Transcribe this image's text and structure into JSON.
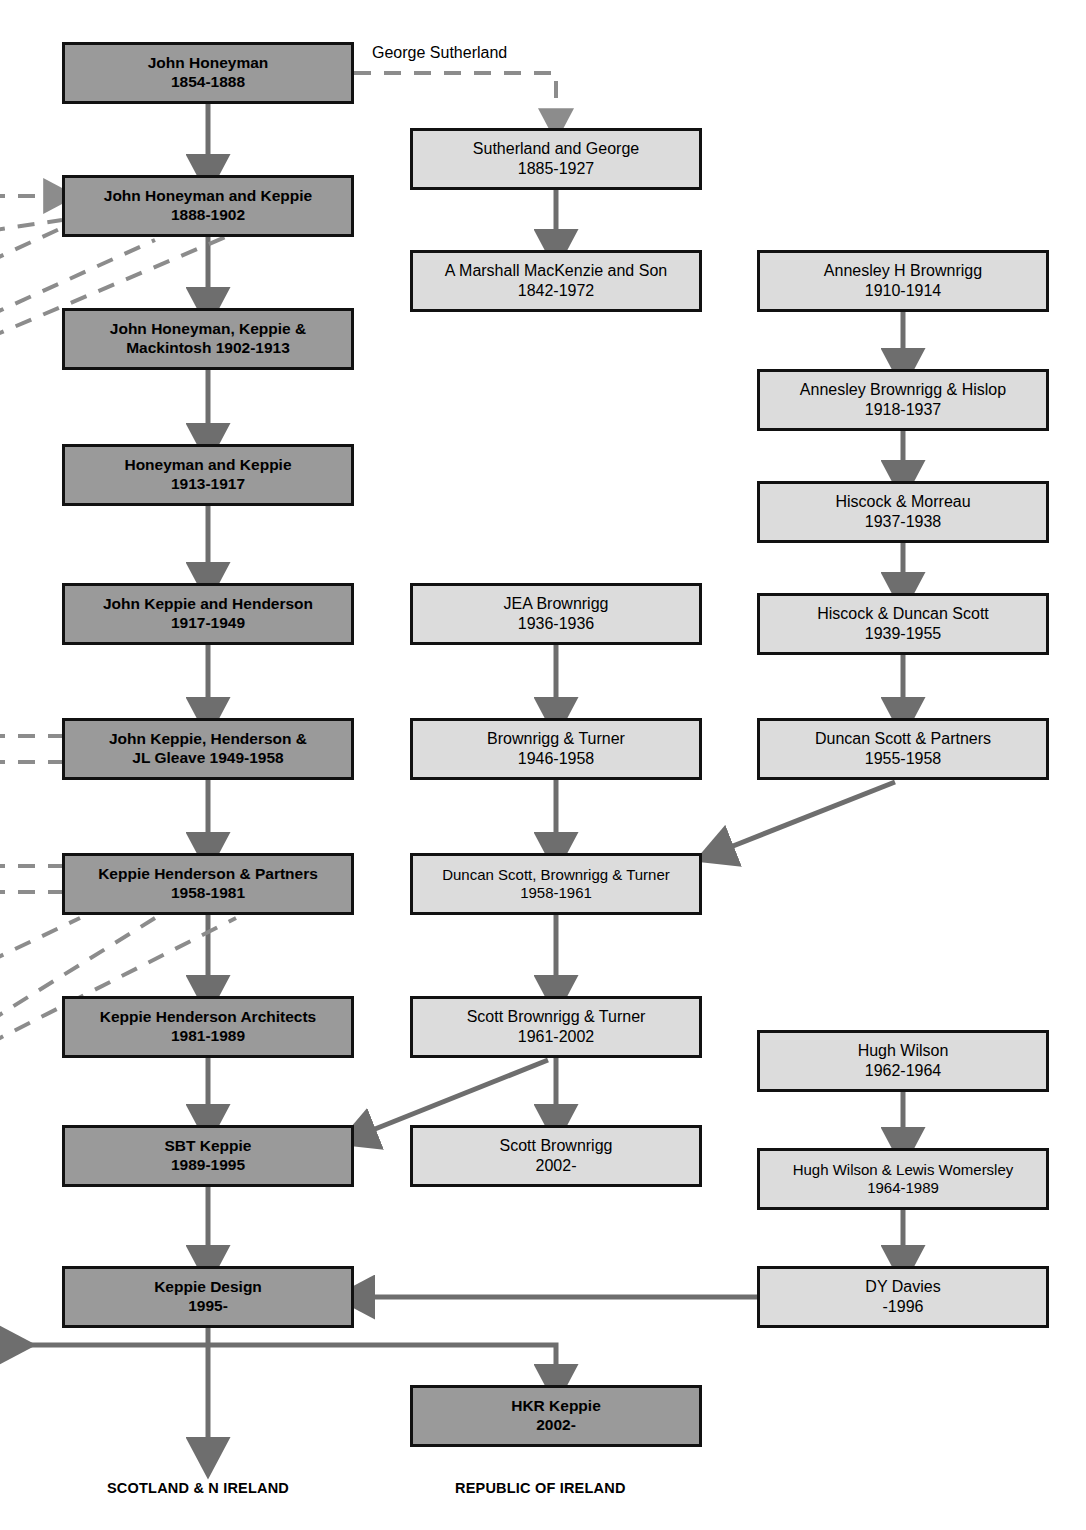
{
  "diagram": {
    "colors": {
      "dark_box_fill": "#9a9a9a",
      "light_box_fill": "#dcdcdc",
      "box_border": "#111111",
      "connector": "#6e6e6e",
      "background": "#ffffff"
    },
    "edge_labels": [
      {
        "id": "george-sutherland",
        "text": "George Sutherland",
        "x": 372,
        "y": 44
      }
    ],
    "region_labels": [
      {
        "id": "scotland-n-ireland",
        "text": "SCOTLAND & N IRELAND",
        "x": 107,
        "y": 1480
      },
      {
        "id": "republic-of-ireland",
        "text": "REPUBLIC OF IRELAND",
        "x": 455,
        "y": 1480
      }
    ],
    "nodes": [
      {
        "id": "john-honeyman",
        "style": "dark",
        "lines": [
          "John Honeyman",
          "1854-1888"
        ],
        "x": 62,
        "y": 42,
        "w": 292,
        "h": 62
      },
      {
        "id": "john-honeyman-and-keppie",
        "style": "dark",
        "lines": [
          "John Honeyman and Keppie",
          "1888-1902"
        ],
        "x": 62,
        "y": 175,
        "w": 292,
        "h": 62
      },
      {
        "id": "john-honeyman-keppie-mackintosh",
        "style": "dark",
        "lines": [
          "John Honeyman, Keppie &",
          "Mackintosh 1902-1913"
        ],
        "x": 62,
        "y": 308,
        "w": 292,
        "h": 62
      },
      {
        "id": "honeyman-and-keppie",
        "style": "dark",
        "lines": [
          "Honeyman and Keppie",
          "1913-1917"
        ],
        "x": 62,
        "y": 444,
        "w": 292,
        "h": 62
      },
      {
        "id": "john-keppie-and-henderson",
        "style": "dark",
        "lines": [
          "John Keppie and Henderson",
          "1917-1949"
        ],
        "x": 62,
        "y": 583,
        "w": 292,
        "h": 62
      },
      {
        "id": "john-keppie-henderson-jl-gleave",
        "style": "dark",
        "lines": [
          "John Keppie, Henderson &",
          "JL Gleave 1949-1958"
        ],
        "x": 62,
        "y": 718,
        "w": 292,
        "h": 62
      },
      {
        "id": "keppie-henderson-and-partners",
        "style": "dark",
        "lines": [
          "Keppie Henderson & Partners",
          "1958-1981"
        ],
        "x": 62,
        "y": 853,
        "w": 292,
        "h": 62
      },
      {
        "id": "keppie-henderson-architects",
        "style": "dark",
        "lines": [
          "Keppie Henderson Architects",
          "1981-1989"
        ],
        "x": 62,
        "y": 996,
        "w": 292,
        "h": 62
      },
      {
        "id": "sbt-keppie",
        "style": "dark",
        "lines": [
          "SBT Keppie",
          "1989-1995"
        ],
        "x": 62,
        "y": 1125,
        "w": 292,
        "h": 62
      },
      {
        "id": "keppie-design",
        "style": "dark",
        "lines": [
          "Keppie Design",
          "1995-"
        ],
        "x": 62,
        "y": 1266,
        "w": 292,
        "h": 62
      },
      {
        "id": "sutherland-and-george",
        "style": "light",
        "lines": [
          "Sutherland and George",
          "1885-1927"
        ],
        "x": 410,
        "y": 128,
        "w": 292,
        "h": 62
      },
      {
        "id": "a-marshall-mackenzie-and-son",
        "style": "light",
        "lines": [
          "A Marshall MacKenzie and Son",
          "1842-1972"
        ],
        "x": 410,
        "y": 250,
        "w": 292,
        "h": 62
      },
      {
        "id": "jea-brownrigg",
        "style": "light",
        "lines": [
          "JEA Brownrigg",
          "1936-1936"
        ],
        "x": 410,
        "y": 583,
        "w": 292,
        "h": 62
      },
      {
        "id": "brownrigg-and-turner",
        "style": "light",
        "lines": [
          "Brownrigg & Turner",
          "1946-1958"
        ],
        "x": 410,
        "y": 718,
        "w": 292,
        "h": 62
      },
      {
        "id": "duncan-scott-brownrigg-turner",
        "style": "light",
        "lines": [
          "Duncan Scott, Brownrigg & Turner",
          "1958-1961"
        ],
        "x": 410,
        "y": 853,
        "w": 292,
        "h": 62
      },
      {
        "id": "scott-brownrigg-and-turner",
        "style": "light",
        "lines": [
          "Scott Brownrigg & Turner",
          "1961-2002"
        ],
        "x": 410,
        "y": 996,
        "w": 292,
        "h": 62
      },
      {
        "id": "scott-brownrigg",
        "style": "light",
        "lines": [
          "Scott Brownrigg",
          "2002-"
        ],
        "x": 410,
        "y": 1125,
        "w": 292,
        "h": 62
      },
      {
        "id": "hkr-keppie",
        "style": "dark",
        "lines": [
          "HKR Keppie",
          "2002-"
        ],
        "x": 410,
        "y": 1385,
        "w": 292,
        "h": 62
      },
      {
        "id": "annesley-h-brownrigg",
        "style": "light",
        "lines": [
          "Annesley H Brownrigg",
          "1910-1914"
        ],
        "x": 757,
        "y": 250,
        "w": 292,
        "h": 62
      },
      {
        "id": "annesley-brownrigg-and-hislop",
        "style": "light",
        "lines": [
          "Annesley Brownrigg & Hislop",
          "1918-1937"
        ],
        "x": 757,
        "y": 369,
        "w": 292,
        "h": 62
      },
      {
        "id": "hiscock-and-morreau",
        "style": "light",
        "lines": [
          "Hiscock & Morreau",
          "1937-1938"
        ],
        "x": 757,
        "y": 481,
        "w": 292,
        "h": 62
      },
      {
        "id": "hiscock-and-duncan-scott",
        "style": "light",
        "lines": [
          "Hiscock & Duncan Scott",
          "1939-1955"
        ],
        "x": 757,
        "y": 593,
        "w": 292,
        "h": 62
      },
      {
        "id": "duncan-scott-and-partners",
        "style": "light",
        "lines": [
          "Duncan Scott & Partners",
          "1955-1958"
        ],
        "x": 757,
        "y": 718,
        "w": 292,
        "h": 62
      },
      {
        "id": "hugh-wilson",
        "style": "light",
        "lines": [
          "Hugh Wilson",
          "1962-1964"
        ],
        "x": 757,
        "y": 1030,
        "w": 292,
        "h": 62
      },
      {
        "id": "hugh-wilson-and-lewis-womersley",
        "style": "light",
        "lines": [
          "Hugh Wilson & Lewis Womersley",
          "1964-1989"
        ],
        "x": 757,
        "y": 1148,
        "w": 292,
        "h": 62
      },
      {
        "id": "dy-davies",
        "style": "light",
        "lines": [
          "DY Davies",
          "-1996"
        ],
        "x": 757,
        "y": 1266,
        "w": 292,
        "h": 62
      }
    ],
    "connectors": [
      {
        "id": "honeyman-to-honeyman-keppie",
        "kind": "solid-vertical-arrow"
      },
      {
        "id": "honeyman-keppie-to-mackintosh",
        "kind": "solid-vertical-arrow"
      },
      {
        "id": "mackintosh-to-honeyman-keppie-1913",
        "kind": "solid-vertical-arrow"
      },
      {
        "id": "honeyman-keppie-1913-to-john-keppie-henderson",
        "kind": "solid-vertical-arrow"
      },
      {
        "id": "john-keppie-henderson-to-gleave",
        "kind": "solid-vertical-arrow"
      },
      {
        "id": "gleave-to-keppie-henderson-partners",
        "kind": "solid-vertical-arrow"
      },
      {
        "id": "keppie-henderson-partners-to-architects",
        "kind": "solid-vertical-arrow"
      },
      {
        "id": "architects-to-sbt-keppie",
        "kind": "solid-vertical-arrow"
      },
      {
        "id": "sbt-keppie-to-keppie-design",
        "kind": "solid-vertical-arrow"
      },
      {
        "id": "keppie-design-to-scotland",
        "kind": "solid-vertical-arrow"
      },
      {
        "id": "honeyman-to-sutherland-george",
        "kind": "dashed-elbow-arrow"
      },
      {
        "id": "sutherland-george-to-mackenzie",
        "kind": "solid-vertical-arrow"
      },
      {
        "id": "jea-brownrigg-to-brownrigg-turner",
        "kind": "solid-vertical-arrow"
      },
      {
        "id": "brownrigg-turner-to-duncan-scott-brownrigg-turner",
        "kind": "solid-vertical-arrow"
      },
      {
        "id": "duncan-scott-brownrigg-turner-to-scott-brownrigg-turner",
        "kind": "solid-vertical-arrow"
      },
      {
        "id": "scott-brownrigg-turner-to-scott-brownrigg",
        "kind": "solid-vertical-arrow"
      },
      {
        "id": "scott-brownrigg-turner-to-sbt-keppie",
        "kind": "solid-diagonal-arrow"
      },
      {
        "id": "annesley-h-to-annesley-hislop",
        "kind": "solid-vertical-arrow"
      },
      {
        "id": "annesley-hislop-to-hiscock-morreau",
        "kind": "solid-vertical-arrow"
      },
      {
        "id": "hiscock-morreau-to-hiscock-duncan-scott",
        "kind": "solid-vertical-arrow"
      },
      {
        "id": "hiscock-duncan-scott-to-duncan-scott-partners",
        "kind": "solid-vertical-arrow"
      },
      {
        "id": "duncan-scott-partners-to-duncan-scott-brownrigg-turner",
        "kind": "solid-diagonal-arrow"
      },
      {
        "id": "hugh-wilson-to-hugh-wilson-womersley",
        "kind": "solid-vertical-arrow"
      },
      {
        "id": "hugh-wilson-womersley-to-dy-davies",
        "kind": "solid-vertical-arrow"
      },
      {
        "id": "dy-davies-to-keppie-design",
        "kind": "solid-horizontal-arrow"
      },
      {
        "id": "offpage-to-hkr-keppie",
        "kind": "solid-elbow-arrow"
      },
      {
        "id": "offpage-dashed-into-honeyman-keppie",
        "kind": "dashed-arrow"
      },
      {
        "id": "offpage-dashed-from-honeyman-keppie",
        "kind": "dashed-fan"
      },
      {
        "id": "offpage-dashed-into-gleave",
        "kind": "dashed-lines"
      },
      {
        "id": "offpage-dashed-into-keppie-henderson-partners",
        "kind": "dashed-lines"
      },
      {
        "id": "offpage-dashed-from-keppie-henderson-partners",
        "kind": "dashed-fan"
      }
    ]
  }
}
